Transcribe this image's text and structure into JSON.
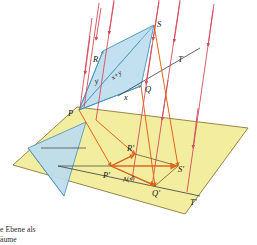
{
  "figure": {
    "colors": {
      "plane_fill": "#f3eda0",
      "plane_stroke": "#8c7a36",
      "quad_fill": "#b9dced",
      "quad_stroke": "#3f93bd",
      "triangle_fill": "#bcdcee",
      "triangle_stroke": "#4b8fb5",
      "ray": "#d44d5c",
      "projected": "#e2651c",
      "axis_line": "#3c3c3c",
      "label": "#16120e"
    },
    "labels": {
      "P": "P",
      "R": "R",
      "S": "S",
      "Q": "Q",
      "T": "T",
      "P_img": "P'",
      "R_img": "R'",
      "S_img": "S'",
      "Q_img": "Q'",
      "T_img": "T'",
      "x": "x",
      "y": "y",
      "xy": "x+y",
      "A": "A(x)"
    },
    "caption": {
      "line1": "e Ebene als",
      "line2": "äume"
    }
  }
}
